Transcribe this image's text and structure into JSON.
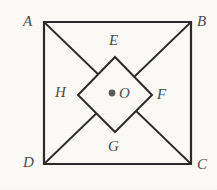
{
  "figure": {
    "kind": "geometry-diagram",
    "background_color": "#fbfaf7",
    "stroke_color": "#2b2b2b",
    "label_color": "#4d4d4d",
    "center_dot_color": "#5a5a5a",
    "stroke_width_outer": 2.2,
    "stroke_width_inner": 2.0,
    "stroke_width_diagonal": 1.8,
    "canvas": {
      "width": 217,
      "height": 190
    }
  },
  "square": {
    "name": "ABCD",
    "vertices": [
      {
        "id": "A",
        "label": "A",
        "x": 44,
        "y": 22
      },
      {
        "id": "B",
        "label": "B",
        "x": 191,
        "y": 22
      },
      {
        "id": "C",
        "label": "C",
        "x": 191,
        "y": 164
      },
      {
        "id": "D",
        "label": "D",
        "x": 44,
        "y": 164
      }
    ]
  },
  "diamond": {
    "name": "EFGH",
    "vertices": [
      {
        "id": "E",
        "label": "E",
        "x": 115,
        "y": 57
      },
      {
        "id": "F",
        "label": "F",
        "x": 152,
        "y": 95
      },
      {
        "id": "G",
        "label": "G",
        "x": 115,
        "y": 132
      },
      {
        "id": "H",
        "label": "H",
        "x": 78,
        "y": 95
      }
    ]
  },
  "center": {
    "id": "O",
    "label": "O",
    "dot_x": 112,
    "dot_y": 93,
    "dot_radius": 3.4
  },
  "diagonals": [
    {
      "from": "A",
      "to": "C",
      "x1": 44,
      "y1": 22,
      "x2": 191,
      "y2": 164
    },
    {
      "from": "B",
      "to": "D",
      "x1": 191,
      "y1": 22,
      "x2": 44,
      "y2": 164
    }
  ],
  "labels": {
    "A": "A",
    "B": "B",
    "C": "C",
    "D": "D",
    "E": "E",
    "F": "F",
    "G": "G",
    "H": "H",
    "O": "O"
  }
}
